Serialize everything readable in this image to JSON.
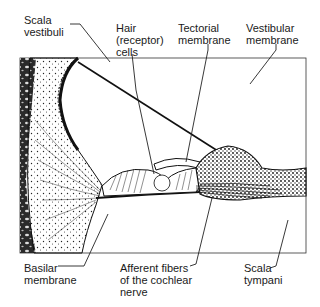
{
  "figure": {
    "labels": {
      "scala_vestibuli": "Scala\nvestibuli",
      "hair_cells": "Hair\n(receptor)\ncells",
      "tectorial_membrane": "Tectorial\nmembrane",
      "vestibular_membrane": "Vestibular\nmembrane",
      "basilar_membrane": "Basilar\nmembrane",
      "afferent_fibers": "Afferent fibers\nof the cochlear\nnerve",
      "scala_tympani": "Scala\ntympani"
    },
    "colors": {
      "ink": "#1a1a1a",
      "background": "#ffffff"
    }
  }
}
